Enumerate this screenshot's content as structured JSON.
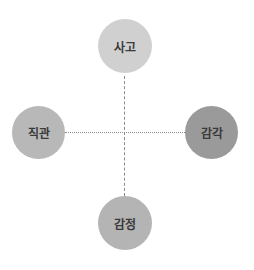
{
  "diagram": {
    "type": "four-quadrant-axes",
    "nodes": {
      "top": {
        "label": "사고",
        "color": "#d0d0d0"
      },
      "left": {
        "label": "직관",
        "color": "#b8b8b8"
      },
      "right": {
        "label": "감각",
        "color": "#9a9a9a"
      },
      "bottom": {
        "label": "감정",
        "color": "#b4b4b4"
      }
    },
    "axes": {
      "vertical": "dashed",
      "horizontal": "dotted"
    }
  }
}
